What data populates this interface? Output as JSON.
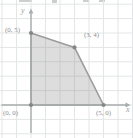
{
  "chart_data": {
    "type": "area",
    "title": "",
    "xlabel": "x",
    "ylabel": "y",
    "polygon_vertices": [
      [
        0,
        0
      ],
      [
        0,
        5
      ],
      [
        3,
        4
      ],
      [
        5,
        0
      ]
    ],
    "vertex_labels": [
      {
        "text": "(0, 5)",
        "point": [
          0,
          5
        ]
      },
      {
        "text": "(3, 4)",
        "point": [
          3,
          4
        ]
      },
      {
        "text": "(0, 0)",
        "point": [
          0,
          0
        ]
      },
      {
        "text": "(5, 0)",
        "point": [
          5,
          0
        ]
      }
    ],
    "xlim": [
      -2,
      7
    ],
    "ylim": [
      -2,
      7
    ],
    "grid": "on",
    "grid_unit": 1,
    "legend": "none"
  },
  "colors": {
    "background": "#ffffff",
    "grid": "#e3e6e6",
    "axis": "#a8adad",
    "region_fill": "rgba(128,128,128,0.27)",
    "region_edge": "#9c9c9c",
    "vertex_dot": "#868686",
    "label_text": "#8f8f8f"
  }
}
